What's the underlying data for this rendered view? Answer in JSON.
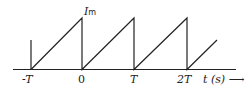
{
  "diagram": {
    "type": "sawtooth-waveform",
    "peak_label": "I",
    "peak_label_sub": "m",
    "x_ticks": [
      "-T",
      "0",
      "T",
      "2T"
    ],
    "x_axis_label": "t (s)",
    "arrow": "⟶",
    "colors": {
      "line": "#222222",
      "background": "#ffffff"
    }
  }
}
